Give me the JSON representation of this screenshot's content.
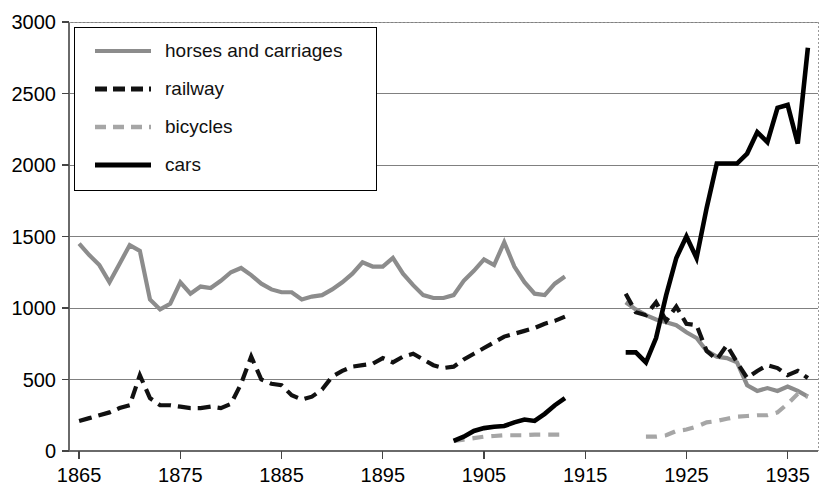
{
  "chart_data": {
    "type": "line",
    "title": "",
    "xlabel": "",
    "ylabel": "",
    "xlim": [
      1864,
      1938
    ],
    "ylim": [
      0,
      3000
    ],
    "yticks": [
      0,
      500,
      1000,
      1500,
      2000,
      2500,
      3000
    ],
    "xticks": [
      1865,
      1875,
      1885,
      1895,
      1905,
      1915,
      1925,
      1935
    ],
    "grid": "horizontal",
    "legend_position": "upper-left-inside",
    "note": "All four series break during the First World War years (1914-1918); data resume in 1919.",
    "series": [
      {
        "name": "horses and carriages",
        "color": "#8c8c8c",
        "style": "solid",
        "width": 4.2,
        "segments": [
          {
            "x": [
              1865,
              1866,
              1867,
              1868,
              1869,
              1870,
              1871,
              1872,
              1873,
              1874,
              1875,
              1876,
              1877,
              1878,
              1879,
              1880,
              1881,
              1882,
              1883,
              1884,
              1885,
              1886,
              1887,
              1888,
              1889,
              1890,
              1891,
              1892,
              1893,
              1894,
              1895,
              1896,
              1897,
              1898,
              1899,
              1900,
              1901,
              1902,
              1903,
              1904,
              1905,
              1906,
              1907,
              1908,
              1909,
              1910,
              1911,
              1912,
              1913
            ],
            "y": [
              1450,
              1370,
              1300,
              1180,
              1310,
              1440,
              1400,
              1060,
              990,
              1030,
              1180,
              1100,
              1150,
              1140,
              1190,
              1250,
              1280,
              1230,
              1170,
              1130,
              1110,
              1110,
              1060,
              1080,
              1090,
              1130,
              1180,
              1240,
              1320,
              1290,
              1290,
              1350,
              1240,
              1160,
              1090,
              1070,
              1070,
              1090,
              1190,
              1260,
              1340,
              1300,
              1460,
              1290,
              1180,
              1100,
              1090,
              1170,
              1220
            ]
          },
          {
            "x": [
              1919,
              1920,
              1921,
              1922,
              1923,
              1924,
              1925,
              1926,
              1927,
              1928,
              1929,
              1930,
              1931,
              1932,
              1933,
              1934,
              1935,
              1936,
              1937
            ],
            "y": [
              1040,
              990,
              950,
              920,
              900,
              880,
              830,
              790,
              700,
              660,
              650,
              620,
              460,
              420,
              440,
              420,
              450,
              420,
              380
            ]
          }
        ]
      },
      {
        "name": "railway",
        "color": "#111111",
        "style": "dashed",
        "width": 4.2,
        "segments": [
          {
            "x": [
              1865,
              1866,
              1867,
              1868,
              1869,
              1870,
              1871,
              1872,
              1873,
              1874,
              1875,
              1876,
              1877,
              1878,
              1879,
              1880,
              1881,
              1882,
              1883,
              1884,
              1885,
              1886,
              1887,
              1888,
              1889,
              1890,
              1891,
              1892,
              1893,
              1894,
              1895,
              1896,
              1897,
              1898,
              1899,
              1900,
              1901,
              1902,
              1903,
              1904,
              1905,
              1906,
              1907,
              1908,
              1909,
              1910,
              1911,
              1912,
              1913
            ],
            "y": [
              210,
              230,
              250,
              270,
              300,
              320,
              530,
              370,
              320,
              320,
              310,
              300,
              300,
              310,
              300,
              330,
              470,
              660,
              500,
              470,
              460,
              390,
              360,
              380,
              430,
              520,
              560,
              590,
              600,
              610,
              650,
              620,
              660,
              680,
              640,
              600,
              580,
              590,
              640,
              680,
              720,
              760,
              800,
              820,
              840,
              860,
              890,
              910,
              940
            ]
          },
          {
            "x": [
              1919,
              1920,
              1921,
              1922,
              1923,
              1924,
              1925,
              1926,
              1927,
              1928,
              1929,
              1930,
              1931,
              1932,
              1933,
              1934,
              1935,
              1936,
              1937
            ],
            "y": [
              1100,
              970,
              950,
              1040,
              910,
              1010,
              890,
              880,
              700,
              640,
              740,
              620,
              510,
              560,
              600,
              580,
              530,
              560,
              510
            ]
          }
        ]
      },
      {
        "name": "bicycles",
        "color": "#a6a6a6",
        "style": "dashed",
        "width": 4.2,
        "segments": [
          {
            "x": [
              1902,
              1903,
              1904,
              1905,
              1906,
              1907,
              1908,
              1909,
              1910,
              1911,
              1912,
              1913
            ],
            "y": [
              70,
              80,
              90,
              100,
              105,
              110,
              110,
              110,
              115,
              115,
              115,
              115
            ]
          },
          {
            "x": [
              1921,
              1922,
              1923,
              1924,
              1925,
              1926,
              1927,
              1928,
              1929,
              1930,
              1931,
              1932,
              1933,
              1934,
              1935,
              1936,
              1937
            ],
            "y": [
              100,
              100,
              110,
              140,
              150,
              170,
              200,
              210,
              225,
              240,
              245,
              250,
              250,
              270,
              330,
              400,
              380
            ]
          }
        ]
      },
      {
        "name": "cars",
        "color": "#000000",
        "style": "solid",
        "width": 4.6,
        "segments": [
          {
            "x": [
              1902,
              1903,
              1904,
              1905,
              1906,
              1907,
              1908,
              1909,
              1910,
              1911,
              1912,
              1913
            ],
            "y": [
              70,
              100,
              140,
              160,
              170,
              175,
              200,
              220,
              210,
              260,
              320,
              370
            ]
          },
          {
            "x": [
              1919,
              1920,
              1921,
              1922,
              1923,
              1924,
              1925,
              1926,
              1927,
              1928,
              1929,
              1930,
              1931,
              1932,
              1933,
              1934,
              1935,
              1936,
              1937
            ],
            "y": [
              690,
              690,
              620,
              790,
              1090,
              1350,
              1500,
              1350,
              1700,
              2010,
              2010,
              2010,
              2080,
              2230,
              2160,
              2400,
              2420,
              2150,
              2820
            ]
          }
        ]
      }
    ]
  },
  "axes": {
    "ytick_labels": [
      "3000",
      "2500",
      "2000",
      "1500",
      "1000",
      "500",
      "0"
    ],
    "xtick_labels": [
      "1865",
      "1875",
      "1885",
      "1895",
      "1905",
      "1915",
      "1925",
      "1935"
    ]
  },
  "legend": {
    "entries": [
      {
        "label": "horses and carriages",
        "swatch": "legend-swatch-horses"
      },
      {
        "label": "railway",
        "swatch": "legend-swatch-railway"
      },
      {
        "label": "bicycles",
        "swatch": "legend-swatch-bicycles"
      },
      {
        "label": "cars",
        "swatch": "legend-swatch-cars"
      }
    ]
  },
  "colors": {
    "horses": "#8c8c8c",
    "railway": "#111111",
    "bicycles": "#a6a6a6",
    "cars": "#000000",
    "grid": "#808080",
    "axis": "#555555",
    "background": "#ffffff"
  }
}
